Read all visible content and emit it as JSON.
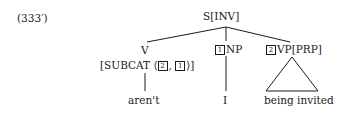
{
  "example_label": "(333′)",
  "tree": {
    "root": {
      "label": "S[INV]"
    },
    "children": [
      {
        "label": "V",
        "features": {
          "prefix": "[SUBCAT ⟨",
          "tag1": "2",
          "sep": ",",
          "tag2": "1",
          "suffix": "⟩]"
        },
        "leaf": "aren't"
      },
      {
        "tag": "1",
        "label": "NP",
        "leaf": "I"
      },
      {
        "tag": "2",
        "label": "VP[PRP]",
        "leaf": "being invited",
        "leaf_style": "triangle"
      }
    ]
  }
}
